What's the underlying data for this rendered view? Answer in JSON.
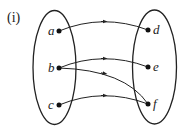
{
  "caption": "(i)",
  "domain_set": {
    "elements": [
      {
        "label": "a",
        "x": 59,
        "y": 31
      },
      {
        "label": "b",
        "x": 59,
        "y": 68
      },
      {
        "label": "c",
        "x": 59,
        "y": 105
      }
    ]
  },
  "codomain_set": {
    "elements": [
      {
        "label": "d",
        "x": 148,
        "y": 30
      },
      {
        "label": "e",
        "x": 148,
        "y": 67
      },
      {
        "label": "f",
        "x": 148,
        "y": 104
      }
    ]
  },
  "mappings": [
    {
      "from": "a",
      "to": "d"
    },
    {
      "from": "b",
      "to": "e"
    },
    {
      "from": "b",
      "to": "f"
    },
    {
      "from": "c",
      "to": "f"
    }
  ],
  "colors": {
    "stroke": "#222222",
    "background": "#ffffff"
  }
}
